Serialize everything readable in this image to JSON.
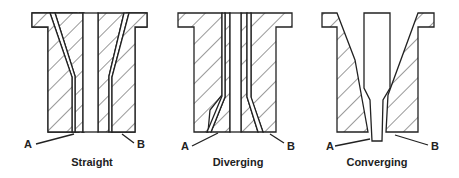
{
  "figure": {
    "panels": [
      {
        "caption": "Straight",
        "label_a": "A",
        "label_b": "B"
      },
      {
        "caption": "Diverging",
        "label_a": "A",
        "label_b": "B"
      },
      {
        "caption": "Converging",
        "label_a": "A",
        "label_b": "B"
      }
    ]
  },
  "colors": {
    "line": "#222222",
    "background": "#ffffff"
  }
}
